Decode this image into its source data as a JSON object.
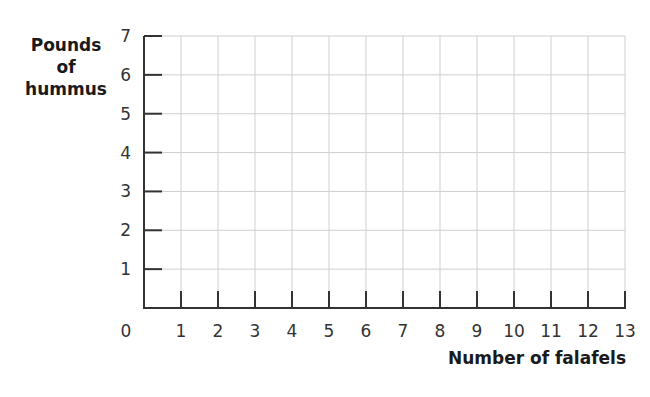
{
  "chart_data": {
    "type": "line",
    "title": "",
    "xlabel": "Number of falafels",
    "ylabel": "Pounds of hummus",
    "ylabel_lines": [
      "Pounds",
      "of",
      "hummus"
    ],
    "x_ticks": [
      0,
      1,
      2,
      3,
      4,
      5,
      6,
      7,
      8,
      9,
      10,
      11,
      12,
      13
    ],
    "y_ticks": [
      1,
      2,
      3,
      4,
      5,
      6,
      7
    ],
    "origin_label": "0",
    "xlim": [
      0,
      13
    ],
    "ylim": [
      0,
      7
    ],
    "grid": true,
    "series": []
  },
  "colors": {
    "axis": "#333333",
    "grid": "#cfcfcf",
    "text": "#222222"
  }
}
